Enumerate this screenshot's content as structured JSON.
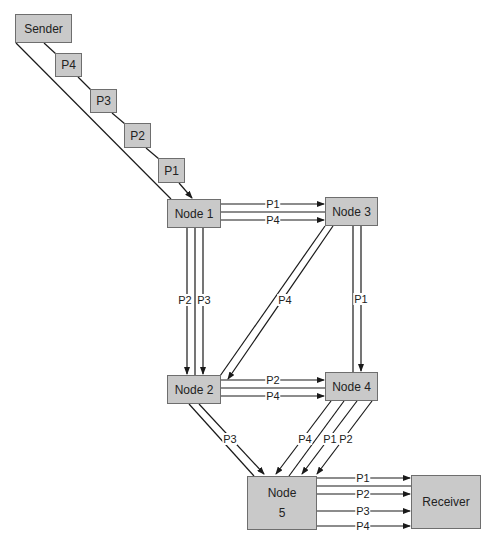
{
  "diagram": {
    "colors": {
      "box_fill": "#c9c9c9",
      "box_border": "#6e6e6e",
      "line": "#1a1a1a",
      "background": "#ffffff"
    },
    "nodes": [
      {
        "id": "sender",
        "label": "Sender",
        "x": 15,
        "y": 14,
        "w": 57,
        "h": 29
      },
      {
        "id": "node1",
        "label": "Node 1",
        "x": 167,
        "y": 199,
        "w": 54,
        "h": 29
      },
      {
        "id": "node3",
        "label": "Node 3",
        "x": 325,
        "y": 197,
        "w": 53,
        "h": 29
      },
      {
        "id": "node2",
        "label": "Node 2",
        "x": 167,
        "y": 375,
        "w": 54,
        "h": 29
      },
      {
        "id": "node4",
        "label": "Node 4",
        "x": 325,
        "y": 372,
        "w": 53,
        "h": 29
      },
      {
        "id": "node5",
        "label": "Node",
        "label2": "5",
        "x": 247,
        "y": 476,
        "w": 70,
        "h": 54
      },
      {
        "id": "receiver",
        "label": "Receiver",
        "x": 411,
        "y": 475,
        "w": 70,
        "h": 54
      }
    ],
    "packets": [
      {
        "id": "p4",
        "label": "P4",
        "x": 55,
        "y": 53,
        "w": 27,
        "h": 24
      },
      {
        "id": "p3",
        "label": "P3",
        "x": 90,
        "y": 89,
        "w": 27,
        "h": 24
      },
      {
        "id": "p2",
        "label": "P2",
        "x": 124,
        "y": 123,
        "w": 27,
        "h": 25
      },
      {
        "id": "p1",
        "label": "P1",
        "x": 158,
        "y": 158,
        "w": 27,
        "h": 25
      }
    ],
    "links": [
      {
        "from": "sender",
        "to": "node1",
        "x1": 16,
        "y1": 43,
        "x2": 171,
        "y2": 199,
        "arrow": false
      },
      {
        "from": "sender",
        "to": "p4",
        "x1": 44,
        "y1": 43,
        "x2": 56,
        "y2": 54,
        "arrow": false
      },
      {
        "from": "p4",
        "to": "p3",
        "x1": 78,
        "y1": 77,
        "x2": 91,
        "y2": 90,
        "arrow": false
      },
      {
        "from": "p3",
        "to": "p2",
        "x1": 112,
        "y1": 113,
        "x2": 125,
        "y2": 124,
        "arrow": false
      },
      {
        "from": "p2",
        "to": "p1",
        "x1": 146,
        "y1": 148,
        "x2": 159,
        "y2": 159,
        "arrow": false
      },
      {
        "from": "p1",
        "to": "node1",
        "x1": 179,
        "y1": 183,
        "x2": 192,
        "y2": 198,
        "arrow": true
      },
      {
        "from": "node1",
        "to": "node3",
        "x1": 221,
        "y1": 204,
        "x2": 324,
        "y2": 204,
        "arrow": true,
        "label": "P1",
        "lx": 273,
        "ly": 204
      },
      {
        "from": "node1",
        "to": "node3",
        "x1": 221,
        "y1": 212,
        "x2": 325,
        "y2": 212,
        "arrow": false
      },
      {
        "from": "node1",
        "to": "node3",
        "x1": 221,
        "y1": 220,
        "x2": 324,
        "y2": 220,
        "arrow": true,
        "label": "P4",
        "lx": 273,
        "ly": 220
      },
      {
        "from": "node1",
        "to": "node2",
        "x1": 187,
        "y1": 228,
        "x2": 187,
        "y2": 374,
        "arrow": true,
        "label": "P2",
        "lx": 185,
        "ly": 300
      },
      {
        "from": "node1",
        "to": "node2",
        "x1": 195,
        "y1": 228,
        "x2": 195,
        "y2": 375,
        "arrow": false
      },
      {
        "from": "node1",
        "to": "node2",
        "x1": 203,
        "y1": 228,
        "x2": 203,
        "y2": 374,
        "arrow": true,
        "label": "P3",
        "lx": 204,
        "ly": 300
      },
      {
        "from": "node3",
        "to": "node4",
        "x1": 353,
        "y1": 226,
        "x2": 353,
        "y2": 372,
        "arrow": false
      },
      {
        "from": "node3",
        "to": "node4",
        "x1": 361,
        "y1": 226,
        "x2": 361,
        "y2": 371,
        "arrow": true,
        "label": "P1",
        "lx": 361,
        "ly": 299
      },
      {
        "from": "node3",
        "to": "node2",
        "x1": 325,
        "y1": 226,
        "x2": 220,
        "y2": 376,
        "arrow": false
      },
      {
        "from": "node3",
        "to": "node2",
        "x1": 333,
        "y1": 226,
        "x2": 228,
        "y2": 379,
        "arrow": true,
        "label": "P4",
        "lx": 285,
        "ly": 300
      },
      {
        "from": "node2",
        "to": "node4",
        "x1": 221,
        "y1": 380,
        "x2": 324,
        "y2": 380,
        "arrow": true,
        "label": "P2",
        "lx": 273,
        "ly": 380
      },
      {
        "from": "node2",
        "to": "node4",
        "x1": 221,
        "y1": 388,
        "x2": 325,
        "y2": 388,
        "arrow": false
      },
      {
        "from": "node2",
        "to": "node4",
        "x1": 221,
        "y1": 396,
        "x2": 324,
        "y2": 396,
        "arrow": true,
        "label": "P4",
        "lx": 273,
        "ly": 396
      },
      {
        "from": "node2",
        "to": "node5",
        "x1": 189,
        "y1": 404,
        "x2": 254,
        "y2": 476,
        "arrow": false
      },
      {
        "from": "node2",
        "to": "node5",
        "x1": 199,
        "y1": 404,
        "x2": 264,
        "y2": 474,
        "arrow": true,
        "label": "P3",
        "lx": 230,
        "ly": 439
      },
      {
        "from": "node4",
        "to": "node5",
        "x1": 331,
        "y1": 401,
        "x2": 276,
        "y2": 474,
        "arrow": true,
        "label": "P4",
        "lx": 305,
        "ly": 439
      },
      {
        "from": "node4",
        "to": "node5",
        "x1": 344,
        "y1": 401,
        "x2": 289,
        "y2": 476,
        "arrow": false
      },
      {
        "from": "node4",
        "to": "node5",
        "x1": 357,
        "y1": 401,
        "x2": 302,
        "y2": 474,
        "arrow": true,
        "label": "P1",
        "lx": 330,
        "ly": 439
      },
      {
        "from": "node4",
        "to": "node5",
        "x1": 372,
        "y1": 401,
        "x2": 317,
        "y2": 474,
        "arrow": true,
        "label": "P2",
        "lx": 346,
        "ly": 439
      },
      {
        "from": "node5",
        "to": "receiver",
        "x1": 317,
        "y1": 478,
        "x2": 410,
        "y2": 478,
        "arrow": true,
        "label": "P1",
        "lx": 363,
        "ly": 478
      },
      {
        "from": "node5",
        "to": "receiver",
        "x1": 317,
        "y1": 486,
        "x2": 411,
        "y2": 486,
        "arrow": false
      },
      {
        "from": "node5",
        "to": "receiver",
        "x1": 317,
        "y1": 494,
        "x2": 410,
        "y2": 494,
        "arrow": true,
        "label": "P2",
        "lx": 363,
        "ly": 494
      },
      {
        "from": "node5",
        "to": "receiver",
        "x1": 317,
        "y1": 511,
        "x2": 410,
        "y2": 511,
        "arrow": true,
        "label": "P3",
        "lx": 363,
        "ly": 511
      },
      {
        "from": "node5",
        "to": "receiver",
        "x1": 317,
        "y1": 526,
        "x2": 410,
        "y2": 526,
        "arrow": true,
        "label": "P4",
        "lx": 363,
        "ly": 526
      }
    ]
  }
}
